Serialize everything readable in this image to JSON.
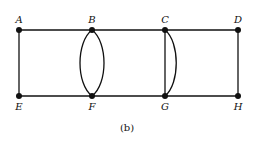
{
  "diagram": {
    "caption": "(b)",
    "type": "graph",
    "nodes": [
      {
        "id": "A",
        "label": "A",
        "x": 19,
        "y": 30,
        "label_pos": "above"
      },
      {
        "id": "B",
        "label": "B",
        "x": 92,
        "y": 30,
        "label_pos": "above"
      },
      {
        "id": "C",
        "label": "C",
        "x": 165,
        "y": 30,
        "label_pos": "above"
      },
      {
        "id": "D",
        "label": "D",
        "x": 238,
        "y": 30,
        "label_pos": "above"
      },
      {
        "id": "E",
        "label": "E",
        "x": 19,
        "y": 96,
        "label_pos": "below"
      },
      {
        "id": "F",
        "label": "F",
        "x": 92,
        "y": 96,
        "label_pos": "below"
      },
      {
        "id": "G",
        "label": "G",
        "x": 165,
        "y": 96,
        "label_pos": "below"
      },
      {
        "id": "H",
        "label": "H",
        "x": 238,
        "y": 96,
        "label_pos": "below"
      }
    ],
    "edges": [
      {
        "from": "A",
        "to": "B",
        "shape": "straight"
      },
      {
        "from": "B",
        "to": "C",
        "shape": "straight"
      },
      {
        "from": "C",
        "to": "D",
        "shape": "straight"
      },
      {
        "from": "E",
        "to": "F",
        "shape": "straight"
      },
      {
        "from": "F",
        "to": "G",
        "shape": "straight"
      },
      {
        "from": "G",
        "to": "H",
        "shape": "straight"
      },
      {
        "from": "A",
        "to": "E",
        "shape": "straight"
      },
      {
        "from": "D",
        "to": "H",
        "shape": "straight"
      },
      {
        "from": "B",
        "to": "F",
        "shape": "curve-left"
      },
      {
        "from": "B",
        "to": "F",
        "shape": "curve-right"
      },
      {
        "from": "C",
        "to": "G",
        "shape": "straight"
      },
      {
        "from": "C",
        "to": "G",
        "shape": "curve-right"
      }
    ]
  }
}
